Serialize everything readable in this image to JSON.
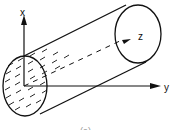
{
  "figure": {
    "type": "cylinder-coordinate-diagram",
    "axes": {
      "x_label": "x",
      "y_label": "y",
      "z_label": "z"
    },
    "caption": "(a)",
    "colors": {
      "stroke": "#111111",
      "background": "#ffffff"
    }
  }
}
